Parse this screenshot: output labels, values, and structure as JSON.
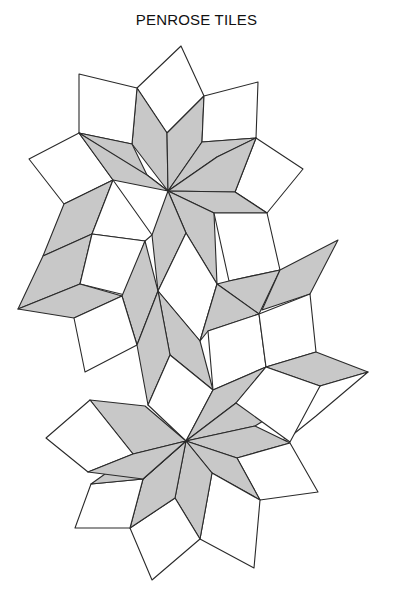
{
  "title": "PENROSE TILES",
  "colors": {
    "gray": "#c8c8c8",
    "white": "#ffffff",
    "stroke": "#2a2a2a"
  },
  "tiles": [
    {
      "fill": "white",
      "pts": [
        [
          137,
          88
        ],
        [
          181,
          46
        ],
        [
          204,
          96
        ],
        [
          167,
          133
        ]
      ]
    },
    {
      "fill": "gray",
      "pts": [
        [
          168,
          191
        ],
        [
          132,
          144
        ],
        [
          137,
          88
        ],
        [
          167,
          133
        ]
      ]
    },
    {
      "fill": "gray",
      "pts": [
        [
          168,
          191
        ],
        [
          167,
          133
        ],
        [
          204,
          96
        ],
        [
          202,
          142
        ]
      ]
    },
    {
      "fill": "white",
      "pts": [
        [
          79,
          74
        ],
        [
          137,
          88
        ],
        [
          132,
          144
        ],
        [
          79,
          133
        ]
      ]
    },
    {
      "fill": "white",
      "pts": [
        [
          202,
          142
        ],
        [
          204,
          96
        ],
        [
          258,
          82
        ],
        [
          256,
          138
        ]
      ]
    },
    {
      "fill": "gray",
      "pts": [
        [
          168,
          191
        ],
        [
          79,
          133
        ],
        [
          132,
          144
        ],
        [
          147,
          175
        ]
      ]
    },
    {
      "fill": "gray",
      "pts": [
        [
          168,
          191
        ],
        [
          202,
          142
        ],
        [
          256,
          138
        ],
        [
          217,
          157
        ]
      ]
    },
    {
      "fill": "white",
      "pts": [
        [
          29,
          159
        ],
        [
          79,
          133
        ],
        [
          113,
          180
        ],
        [
          64,
          204
        ]
      ]
    },
    {
      "fill": "white",
      "pts": [
        [
          256,
          138
        ],
        [
          303,
          169
        ],
        [
          267,
          213
        ],
        [
          235,
          192
        ]
      ]
    },
    {
      "fill": "gray",
      "pts": [
        [
          168,
          191
        ],
        [
          113,
          180
        ],
        [
          79,
          133
        ],
        [
          147,
          175
        ]
      ]
    },
    {
      "fill": "gray",
      "pts": [
        [
          168,
          191
        ],
        [
          217,
          157
        ],
        [
          256,
          138
        ],
        [
          235,
          192
        ]
      ]
    },
    {
      "fill": "gray",
      "pts": [
        [
          168,
          191
        ],
        [
          235,
          192
        ],
        [
          267,
          213
        ],
        [
          214,
          213
        ]
      ]
    },
    {
      "fill": "gray",
      "pts": [
        [
          168,
          191
        ],
        [
          186,
          233
        ],
        [
          217,
          284
        ],
        [
          214,
          213
        ]
      ]
    },
    {
      "fill": "gray",
      "pts": [
        [
          168,
          191
        ],
        [
          152,
          235
        ],
        [
          158,
          291
        ],
        [
          186,
          233
        ]
      ]
    },
    {
      "fill": "white",
      "pts": [
        [
          214,
          213
        ],
        [
          267,
          213
        ],
        [
          280,
          270
        ],
        [
          229,
          281
        ]
      ]
    },
    {
      "fill": "gray",
      "pts": [
        [
          64,
          204
        ],
        [
          113,
          180
        ],
        [
          92,
          234
        ],
        [
          43,
          256
        ]
      ]
    },
    {
      "fill": "white",
      "pts": [
        [
          113,
          180
        ],
        [
          152,
          235
        ],
        [
          145,
          241
        ],
        [
          92,
          234
        ]
      ]
    },
    {
      "fill": "gray",
      "pts": [
        [
          43,
          256
        ],
        [
          92,
          234
        ],
        [
          80,
          284
        ],
        [
          18,
          309
        ]
      ]
    },
    {
      "fill": "white",
      "pts": [
        [
          92,
          234
        ],
        [
          145,
          241
        ],
        [
          125,
          295
        ],
        [
          80,
          284
        ]
      ]
    },
    {
      "fill": "gray",
      "pts": [
        [
          18,
          309
        ],
        [
          80,
          284
        ],
        [
          122,
          296
        ],
        [
          74,
          318
        ]
      ]
    },
    {
      "fill": "gray",
      "pts": [
        [
          145,
          241
        ],
        [
          158,
          291
        ],
        [
          137,
          345
        ],
        [
          122,
          296
        ]
      ]
    },
    {
      "fill": "white",
      "pts": [
        [
          74,
          318
        ],
        [
          122,
          296
        ],
        [
          137,
          345
        ],
        [
          85,
          372
        ]
      ]
    },
    {
      "fill": "white",
      "pts": [
        [
          158,
          291
        ],
        [
          186,
          233
        ],
        [
          217,
          284
        ],
        [
          200,
          341
        ]
      ]
    },
    {
      "fill": "gray",
      "pts": [
        [
          158,
          291
        ],
        [
          200,
          341
        ],
        [
          213,
          390
        ],
        [
          170,
          355
        ]
      ]
    },
    {
      "fill": "gray",
      "pts": [
        [
          137,
          345
        ],
        [
          158,
          291
        ],
        [
          170,
          355
        ],
        [
          148,
          405
        ]
      ]
    },
    {
      "fill": "gray",
      "pts": [
        [
          217,
          284
        ],
        [
          229,
          281
        ],
        [
          280,
          270
        ],
        [
          259,
          314
        ]
      ]
    },
    {
      "fill": "gray",
      "pts": [
        [
          200,
          341
        ],
        [
          217,
          284
        ],
        [
          259,
          314
        ],
        [
          208,
          331
        ]
      ]
    },
    {
      "fill": "gray",
      "pts": [
        [
          262,
          310
        ],
        [
          280,
          270
        ],
        [
          338,
          240
        ],
        [
          310,
          294
        ]
      ]
    },
    {
      "fill": "white",
      "pts": [
        [
          208,
          331
        ],
        [
          259,
          314
        ],
        [
          266,
          367
        ],
        [
          213,
          390
        ]
      ]
    },
    {
      "fill": "white",
      "pts": [
        [
          259,
          314
        ],
        [
          310,
          294
        ],
        [
          316,
          352
        ],
        [
          266,
          367
        ]
      ]
    },
    {
      "fill": "gray",
      "pts": [
        [
          266,
          367
        ],
        [
          316,
          352
        ],
        [
          368,
          372
        ],
        [
          320,
          386
        ]
      ]
    },
    {
      "fill": "white",
      "pts": [
        [
          320,
          386
        ],
        [
          368,
          372
        ],
        [
          316,
          416
        ],
        [
          280,
          445
        ]
      ]
    },
    {
      "fill": "white",
      "pts": [
        [
          148,
          405
        ],
        [
          170,
          355
        ],
        [
          213,
          390
        ],
        [
          186,
          441
        ]
      ]
    },
    {
      "fill": "gray",
      "pts": [
        [
          186,
          441
        ],
        [
          213,
          390
        ],
        [
          266,
          367
        ],
        [
          236,
          403
        ]
      ]
    },
    {
      "fill": "gray",
      "pts": [
        [
          186,
          441
        ],
        [
          236,
          403
        ],
        [
          320,
          386
        ],
        [
          255,
          426
        ]
      ]
    },
    {
      "fill": "white",
      "pts": [
        [
          236,
          403
        ],
        [
          266,
          367
        ],
        [
          320,
          386
        ],
        [
          290,
          442
        ]
      ]
    },
    {
      "fill": "gray",
      "pts": [
        [
          186,
          441
        ],
        [
          255,
          426
        ],
        [
          290,
          443
        ],
        [
          237,
          458
        ]
      ]
    },
    {
      "fill": "white",
      "pts": [
        [
          237,
          458
        ],
        [
          290,
          443
        ],
        [
          318,
          492
        ],
        [
          260,
          500
        ]
      ]
    },
    {
      "fill": "gray",
      "pts": [
        [
          186,
          441
        ],
        [
          237,
          458
        ],
        [
          260,
          500
        ],
        [
          212,
          473
        ]
      ]
    },
    {
      "fill": "white",
      "pts": [
        [
          212,
          473
        ],
        [
          260,
          500
        ],
        [
          254,
          568
        ],
        [
          200,
          539
        ]
      ]
    },
    {
      "fill": "gray",
      "pts": [
        [
          186,
          441
        ],
        [
          212,
          473
        ],
        [
          200,
          539
        ],
        [
          175,
          498
        ]
      ]
    },
    {
      "fill": "white",
      "pts": [
        [
          175,
          498
        ],
        [
          200,
          539
        ],
        [
          152,
          580
        ],
        [
          130,
          528
        ]
      ]
    },
    {
      "fill": "gray",
      "pts": [
        [
          186,
          441
        ],
        [
          175,
          498
        ],
        [
          130,
          528
        ],
        [
          143,
          479
        ]
      ]
    },
    {
      "fill": "white",
      "pts": [
        [
          91,
          484
        ],
        [
          143,
          479
        ],
        [
          130,
          528
        ],
        [
          75,
          528
        ]
      ]
    },
    {
      "fill": "gray",
      "pts": [
        [
          186,
          441
        ],
        [
          143,
          479
        ],
        [
          91,
          484
        ],
        [
          133,
          454
        ]
      ]
    },
    {
      "fill": "gray",
      "pts": [
        [
          186,
          441
        ],
        [
          133,
          454
        ],
        [
          90,
          400
        ],
        [
          145,
          406
        ]
      ]
    },
    {
      "fill": "white",
      "pts": [
        [
          46,
          438
        ],
        [
          90,
          400
        ],
        [
          133,
          454
        ],
        [
          88,
          472
        ]
      ]
    },
    {
      "fill": "gray",
      "pts": [
        [
          88,
          472
        ],
        [
          133,
          454
        ],
        [
          186,
          441
        ],
        [
          143,
          479
        ]
      ]
    }
  ]
}
